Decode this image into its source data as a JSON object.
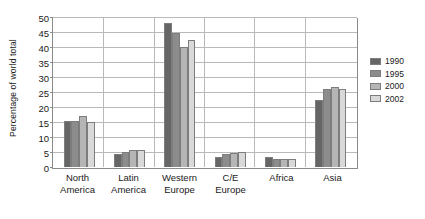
{
  "chart_data": {
    "type": "bar",
    "title": "",
    "xlabel": "",
    "ylabel": "Percentage of world total",
    "ylim": [
      0,
      50
    ],
    "yticks": [
      0,
      5,
      10,
      15,
      20,
      25,
      30,
      35,
      40,
      45,
      50
    ],
    "grid": true,
    "legend_position": "right",
    "categories": [
      "North America",
      "Latin America",
      "Western Europe",
      "C/E Europe",
      "Africa",
      "Asia"
    ],
    "category_lines": [
      [
        "North",
        "America"
      ],
      [
        "Latin",
        "America"
      ],
      [
        "Western",
        "Europe"
      ],
      [
        "C/E",
        "Europe"
      ],
      [
        "Africa",
        ""
      ],
      [
        "Asia",
        ""
      ]
    ],
    "series": [
      {
        "name": "1990",
        "color": "#666666",
        "values": [
          15.3,
          4.3,
          48.2,
          3.5,
          3.2,
          22.5
        ]
      },
      {
        "name": "1995",
        "color": "#8c8c8c",
        "values": [
          15.6,
          5.0,
          45.0,
          4.4,
          2.6,
          26.2
        ]
      },
      {
        "name": "2000",
        "color": "#b5b5b5",
        "values": [
          17.0,
          5.8,
          40.2,
          4.8,
          2.6,
          26.7
        ]
      },
      {
        "name": "2002",
        "color": "#d9d9d9",
        "values": [
          15.2,
          5.6,
          42.6,
          5.0,
          2.7,
          26.2
        ]
      }
    ]
  },
  "colors": {
    "axis": "#8a8a8a",
    "gridline": "#b9b9b9",
    "text": "#1a1a1a",
    "background": "#ffffff"
  }
}
